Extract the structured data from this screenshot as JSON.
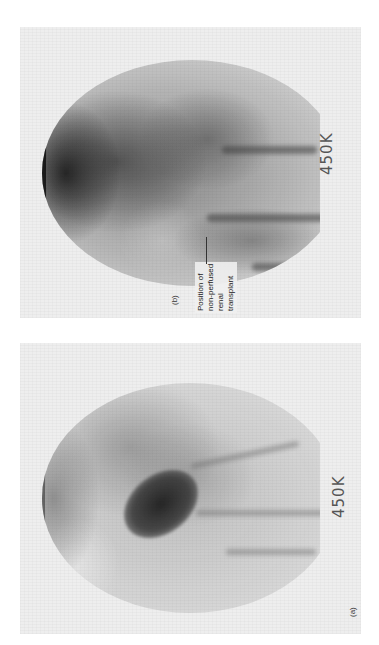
{
  "figure": {
    "orientation": "rotated 90 degrees counter-clockwise",
    "panels": [
      {
        "id": "b",
        "label": "(b)",
        "count_label": "450K",
        "annotation": {
          "lines": [
            "Position of",
            "non-perfused",
            "renal",
            "transplant"
          ]
        }
      },
      {
        "id": "a",
        "label": "(a)",
        "count_label": "450K"
      }
    ]
  }
}
